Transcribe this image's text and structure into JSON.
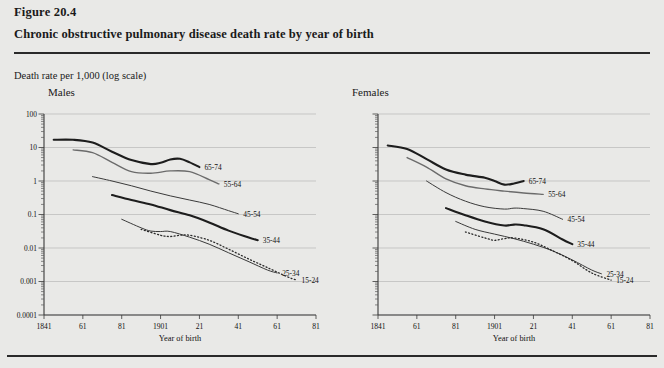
{
  "figure": {
    "number": "Figure 20.4",
    "title": "Chronic obstructive pulmonary disease death rate by year of birth",
    "axis_note": "Death rate per 1,000 (log scale)"
  },
  "chart_data": [
    {
      "type": "line",
      "title": "Males",
      "xlabel": "Year of birth",
      "ylabel": "Death rate per 1,000 (log scale)",
      "log_y": true,
      "ylim": [
        0.0001,
        100
      ],
      "xlim": [
        1841,
        1981
      ],
      "grid": true,
      "legend_position": "inline-end-of-line",
      "ytick_labels": [
        "100",
        "10",
        "1",
        "0.1",
        "0.01",
        "0.001",
        "0.0001"
      ],
      "ytick_values": [
        100,
        10,
        1,
        0.1,
        0.01,
        0.001,
        0.0001
      ],
      "xtick_labels": [
        "1841",
        "61",
        "81",
        "1901",
        "21",
        "41",
        "61",
        "81"
      ],
      "xtick_values": [
        1841,
        1861,
        1881,
        1901,
        1921,
        1941,
        1961,
        1981
      ],
      "series": [
        {
          "name": "65-74",
          "style": "solid-thick",
          "color": "#1d1d1d",
          "x": [
            1846,
            1856,
            1866,
            1876,
            1886,
            1896,
            1901,
            1906,
            1911,
            1916,
            1921
          ],
          "y": [
            17,
            17,
            14,
            7.5,
            4.2,
            3.2,
            3.5,
            4.4,
            4.6,
            3.6,
            2.6
          ]
        },
        {
          "name": "55-64",
          "style": "solid-medium",
          "color": "#6b6b6b",
          "x": [
            1856,
            1866,
            1876,
            1886,
            1896,
            1906,
            1916,
            1926,
            1931
          ],
          "y": [
            8.5,
            7.0,
            3.6,
            1.9,
            1.7,
            2.0,
            1.9,
            1.1,
            0.82
          ]
        },
        {
          "name": "45-54",
          "style": "solid-thin",
          "color": "#3a3a3a",
          "x": [
            1866,
            1876,
            1886,
            1896,
            1906,
            1916,
            1926,
            1936,
            1941
          ],
          "y": [
            1.35,
            1.0,
            0.72,
            0.5,
            0.36,
            0.27,
            0.2,
            0.13,
            0.105
          ]
        },
        {
          "name": "35-44",
          "style": "solid-thick",
          "color": "#1d1d1d",
          "x": [
            1876,
            1886,
            1896,
            1906,
            1916,
            1926,
            1936,
            1946,
            1951
          ],
          "y": [
            0.38,
            0.27,
            0.2,
            0.135,
            0.095,
            0.058,
            0.033,
            0.021,
            0.017
          ]
        },
        {
          "name": "25-34",
          "style": "solid-thin",
          "color": "#3a3a3a",
          "x": [
            1881,
            1891,
            1896,
            1901,
            1906,
            1916,
            1926,
            1936,
            1946,
            1956,
            1961
          ],
          "y": [
            0.072,
            0.04,
            0.032,
            0.031,
            0.031,
            0.021,
            0.013,
            0.0072,
            0.004,
            0.0022,
            0.0018
          ]
        },
        {
          "name": "15-24",
          "style": "dotted",
          "color": "#2a2a2a",
          "x": [
            1891,
            1901,
            1906,
            1911,
            1916,
            1926,
            1936,
            1946,
            1956,
            1966,
            1971
          ],
          "y": [
            0.036,
            0.024,
            0.022,
            0.024,
            0.024,
            0.017,
            0.0092,
            0.0048,
            0.0026,
            0.0014,
            0.0011
          ]
        }
      ]
    },
    {
      "type": "line",
      "title": "Females",
      "xlabel": "Year of birth",
      "ylabel": "Death rate per 1,000 (log scale)",
      "log_y": true,
      "ylim": [
        0.0001,
        100
      ],
      "xlim": [
        1841,
        1981
      ],
      "grid": true,
      "legend_position": "inline-end-of-line",
      "ytick_labels": [],
      "ytick_values": [
        100,
        10,
        1,
        0.1,
        0.01,
        0.001,
        0.0001
      ],
      "xtick_labels": [
        "1841",
        "61",
        "81",
        "1901",
        "21",
        "41",
        "61",
        "81"
      ],
      "xtick_values": [
        1841,
        1861,
        1881,
        1901,
        1921,
        1941,
        1961,
        1981
      ],
      "series": [
        {
          "name": "65-74",
          "style": "solid-thick",
          "color": "#1d1d1d",
          "x": [
            1846,
            1856,
            1866,
            1876,
            1886,
            1896,
            1901,
            1906,
            1911,
            1916
          ],
          "y": [
            11.5,
            9.0,
            4.5,
            2.2,
            1.55,
            1.25,
            1.0,
            0.78,
            0.84,
            1.0
          ]
        },
        {
          "name": "55-64",
          "style": "solid-medium",
          "color": "#6b6b6b",
          "x": [
            1856,
            1866,
            1876,
            1886,
            1896,
            1906,
            1916,
            1926
          ],
          "y": [
            5.0,
            2.6,
            1.15,
            0.72,
            0.58,
            0.5,
            0.44,
            0.4
          ]
        },
        {
          "name": "45-54",
          "style": "solid-thin",
          "color": "#3a3a3a",
          "x": [
            1866,
            1876,
            1886,
            1896,
            1906,
            1911,
            1916,
            1926,
            1936
          ],
          "y": [
            1.0,
            0.45,
            0.25,
            0.17,
            0.145,
            0.155,
            0.15,
            0.125,
            0.072
          ]
        },
        {
          "name": "35-44",
          "style": "solid-thick",
          "color": "#1d1d1d",
          "x": [
            1876,
            1886,
            1896,
            1906,
            1911,
            1916,
            1926,
            1936,
            1941
          ],
          "y": [
            0.155,
            0.095,
            0.062,
            0.047,
            0.05,
            0.048,
            0.036,
            0.018,
            0.013
          ]
        },
        {
          "name": "25-34",
          "style": "solid-thin",
          "color": "#3a3a3a",
          "x": [
            1881,
            1891,
            1901,
            1911,
            1921,
            1931,
            1941,
            1951,
            1956
          ],
          "y": [
            0.062,
            0.036,
            0.026,
            0.019,
            0.013,
            0.0082,
            0.0044,
            0.0022,
            0.0017
          ]
        },
        {
          "name": "15-24",
          "style": "dotted",
          "color": "#2a2a2a",
          "x": [
            1886,
            1896,
            1901,
            1906,
            1911,
            1921,
            1931,
            1941,
            1951,
            1961
          ],
          "y": [
            0.03,
            0.02,
            0.017,
            0.019,
            0.02,
            0.015,
            0.0082,
            0.0042,
            0.0018,
            0.0011
          ]
        }
      ]
    }
  ]
}
